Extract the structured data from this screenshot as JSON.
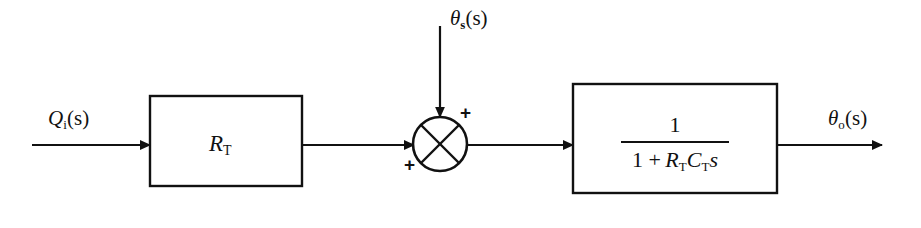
{
  "diagram": {
    "type": "control-block-diagram",
    "background_color": "#ffffff",
    "line_color": "#111111"
  },
  "signals": {
    "input": {
      "name": "Qi(s)",
      "base": "Q",
      "subscript": "i",
      "argument": "(s)"
    },
    "disturbance": {
      "name": "θs(s)",
      "base": "θ",
      "subscript": "s",
      "argument": "(s)"
    },
    "output": {
      "name": "θo(s)",
      "base": "θ",
      "subscript": "o",
      "argument": "(s)"
    }
  },
  "blocks": [
    {
      "id": "gain-block",
      "label": "RT",
      "base": "R",
      "subscript": "T"
    },
    {
      "id": "transfer-function-block",
      "numerator": "1",
      "denominator_prefix": "1 + ",
      "denominator_r": "R",
      "denominator_r_sub": "T",
      "denominator_c": "C",
      "denominator_c_sub": "T",
      "denominator_s": "s",
      "label": "1 / (1 + RT CT s)"
    }
  ],
  "summing_junction": {
    "id": "summing-junction",
    "shape": "circle-with-cross",
    "input_sign_left": "+",
    "input_sign_top": "+"
  }
}
